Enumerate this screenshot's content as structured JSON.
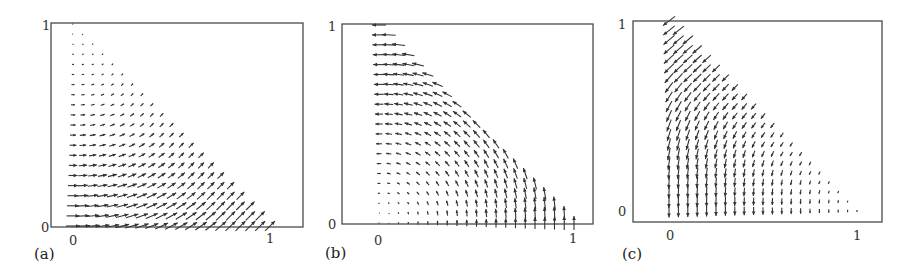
{
  "figure": {
    "panels": [
      {
        "id": "a",
        "label": "(a)",
        "xticks": [
          "0",
          "1"
        ],
        "yticks": [
          "0",
          "1"
        ],
        "field": "outward-upward",
        "description": "Vector field on triangle x+y<=1; arrows point right/up-right, growing with x and decreasing with y"
      },
      {
        "id": "b",
        "label": "(b)",
        "xticks": [
          "0",
          "1"
        ],
        "yticks": [
          "0",
          "1"
        ],
        "field": "rotational",
        "description": "Vector field on triangle x+y<=1; arrows point up near x=1 axis and left near y=1, circular rotation"
      },
      {
        "id": "c",
        "label": "(c)",
        "xticks": [
          "0",
          "1"
        ],
        "yticks": [
          "0",
          "1"
        ],
        "field": "inward-downward",
        "description": "Vector field on triangle x+y<=1; arrows point down-left, strongest near x=0"
      }
    ],
    "grid_step": 0.05,
    "domain": "x >= 0, y >= 0, x + y <= 1"
  },
  "chart_data": [
    {
      "type": "quiver",
      "title": "(a)",
      "xlabel": "",
      "ylabel": "",
      "xticks": [
        0,
        1
      ],
      "yticks": [
        0,
        1
      ],
      "xlim": [
        -0.1,
        1.18
      ],
      "ylim": [
        -0.02,
        1.0
      ],
      "grid": false,
      "domain": "simplex x+y<=1, step 0.05",
      "field_direction": "right at left edge, rotating to up-right toward hypotenuse; magnitude largest at bottom-right"
    },
    {
      "type": "quiver",
      "title": "(b)",
      "xlabel": "",
      "ylabel": "",
      "xticks": [
        0,
        1
      ],
      "yticks": [
        0,
        1
      ],
      "xlim": [
        -0.2,
        1.12
      ],
      "ylim": [
        0,
        1.0
      ],
      "grid": false,
      "domain": "simplex x+y<=1, step 0.05",
      "field_direction": "up along bottom, rotating counter-clockwise to left at top; magnitude largest near hypotenuse"
    },
    {
      "type": "quiver",
      "title": "(c)",
      "xlabel": "",
      "ylabel": "",
      "xticks": [
        0,
        1
      ],
      "yticks": [
        0,
        1
      ],
      "xlim": [
        -0.2,
        1.12
      ],
      "ylim": [
        -0.06,
        1.0
      ],
      "grid": false,
      "domain": "simplex x+y<=1, step 0.05",
      "field_direction": "down along left edge, down-left toward top; magnitude largest near x=0 top"
    }
  ]
}
